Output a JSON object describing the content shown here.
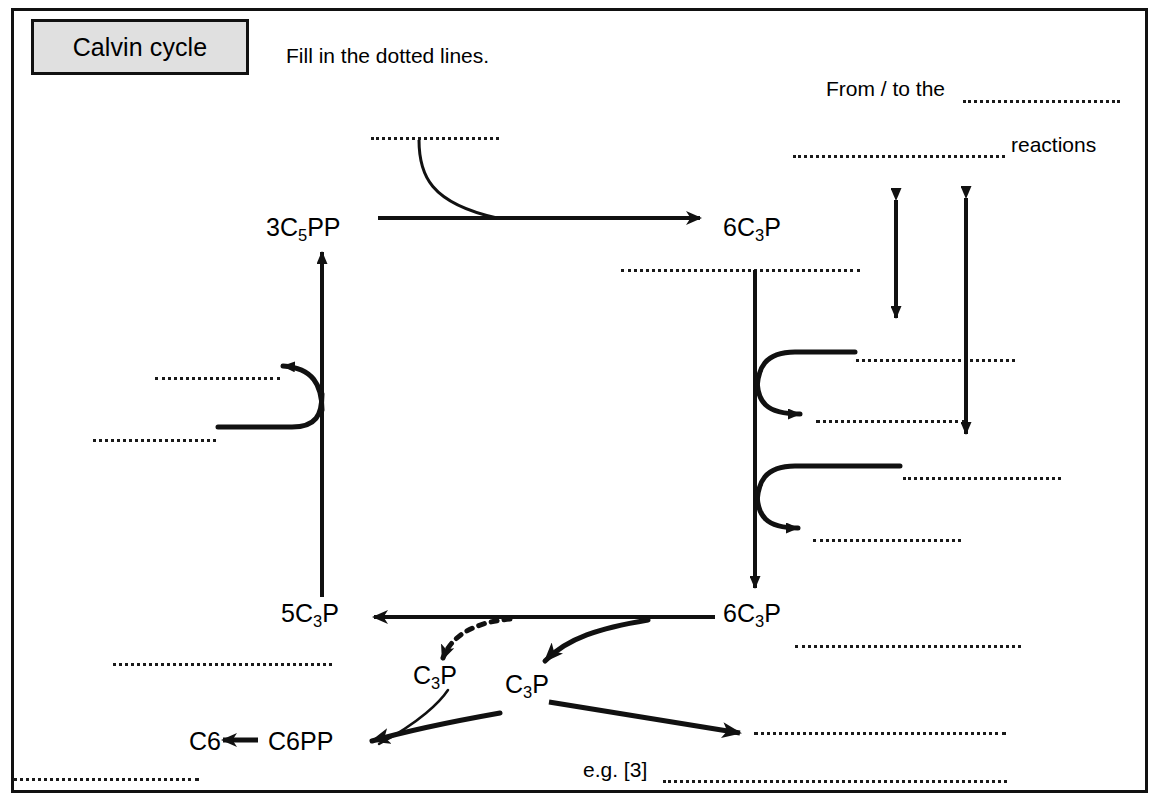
{
  "document": {
    "title_box_label": "Calvin cycle",
    "instruction": "Fill in the dotted lines.",
    "border_color": "#111111",
    "title_box_fill": "#e0e0e0"
  },
  "annotations": {
    "from_to_the": "From / to the",
    "reactions": "reactions",
    "eg_three": "e.g. [3]"
  },
  "molecules": {
    "three_c5pp": {
      "prefix": "3C",
      "sub": "5",
      "suffix": "PP"
    },
    "six_c3p_top": {
      "prefix": "6C",
      "sub": "3",
      "suffix": "P"
    },
    "six_c3p_bottom": {
      "prefix": "6C",
      "sub": "3",
      "suffix": "P"
    },
    "five_c3p": {
      "prefix": "5C",
      "sub": "3",
      "suffix": "P"
    },
    "c3p_left": {
      "prefix": "C",
      "sub": "3",
      "suffix": "P"
    },
    "c3p_right": {
      "prefix": "C",
      "sub": "3",
      "suffix": "P"
    },
    "c6pp": {
      "prefix": "C6PP",
      "sub": "",
      "suffix": ""
    },
    "c6": {
      "prefix": "C6",
      "sub": "",
      "suffix": ""
    }
  },
  "blank_lines": [
    {
      "id": "blank-top-carbon-source",
      "x": 371,
      "y": 137,
      "width": 128
    },
    {
      "id": "blank-from-to-the",
      "x": 963,
      "y": 100,
      "width": 157
    },
    {
      "id": "blank-reactions-name",
      "x": 793,
      "y": 155,
      "width": 212
    },
    {
      "id": "blank-below-six-c3p-top",
      "x": 621,
      "y": 269,
      "width": 239
    },
    {
      "id": "blank-right-reactant-one",
      "x": 856,
      "y": 359,
      "width": 159
    },
    {
      "id": "blank-right-product-one",
      "x": 816,
      "y": 420,
      "width": 150
    },
    {
      "id": "blank-right-reactant-two",
      "x": 903,
      "y": 477,
      "width": 158
    },
    {
      "id": "blank-right-product-two",
      "x": 813,
      "y": 539,
      "width": 148
    },
    {
      "id": "blank-left-product",
      "x": 155,
      "y": 377,
      "width": 125
    },
    {
      "id": "blank-left-reactant",
      "x": 93,
      "y": 439,
      "width": 123
    },
    {
      "id": "blank-below-five-c3p",
      "x": 113,
      "y": 663,
      "width": 219
    },
    {
      "id": "blank-bottom-left-footnote",
      "x": 13,
      "y": 778,
      "width": 186
    },
    {
      "id": "blank-right-of-six-c3p",
      "x": 795,
      "y": 645,
      "width": 226
    },
    {
      "id": "blank-c3p-output",
      "x": 754,
      "y": 732,
      "width": 252
    },
    {
      "id": "blank-eg-three",
      "x": 663,
      "y": 780,
      "width": 344
    }
  ],
  "arrows": [
    {
      "id": "arrow-three-c5pp-to-six-c3p",
      "type": "straight-right"
    },
    {
      "id": "arrow-curve-into-carboxylation",
      "type": "curved-feed-in"
    },
    {
      "id": "arrow-six-c3p-down",
      "type": "straight-down"
    },
    {
      "id": "arrow-reduction-reactant-one",
      "type": "curved-in"
    },
    {
      "id": "arrow-reduction-product-one",
      "type": "curved-out"
    },
    {
      "id": "arrow-reduction-reactant-two",
      "type": "curved-in"
    },
    {
      "id": "arrow-reduction-product-two",
      "type": "curved-out"
    },
    {
      "id": "arrow-six-c3p-to-five-c3p",
      "type": "straight-left"
    },
    {
      "id": "arrow-five-c3p-up",
      "type": "straight-up"
    },
    {
      "id": "arrow-regeneration-in",
      "type": "curved-hook-left"
    },
    {
      "id": "arrow-dotted-to-c3p",
      "type": "dotted-curve"
    },
    {
      "id": "arrow-six-c3p-to-c3p-right",
      "type": "curved-down-left"
    },
    {
      "id": "arrow-c3p-to-c6pp",
      "type": "curved-down-left"
    },
    {
      "id": "arrow-c3p-to-output",
      "type": "straight-diagonal"
    },
    {
      "id": "arrow-c6pp-to-c6",
      "type": "straight-left"
    },
    {
      "id": "double-arrow-short",
      "type": "double-headed-vertical"
    },
    {
      "id": "double-arrow-long",
      "type": "double-headed-vertical"
    }
  ]
}
